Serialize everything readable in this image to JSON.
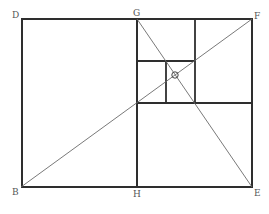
{
  "diagram": {
    "colors": {
      "background": "#ffffff",
      "frame": "#2e2e2e",
      "diagonal": "#6a6a6a",
      "label": "#555555"
    },
    "points": {
      "D": {
        "label": "D",
        "x": 22,
        "y": 19
      },
      "G": {
        "label": "G",
        "x": 137,
        "y": 19
      },
      "F": {
        "label": "F",
        "x": 252,
        "y": 19
      },
      "E": {
        "label": "E",
        "x": 252,
        "y": 187
      },
      "H": {
        "label": "H",
        "x": 137,
        "y": 187
      },
      "B": {
        "label": "B",
        "x": 21,
        "y": 187
      },
      "O": {
        "label": "O",
        "x": 175,
        "y": 75
      }
    },
    "labels": {
      "D": "D",
      "G": "G",
      "F": "F",
      "E": "E",
      "H": "H",
      "B": "B",
      "O": "O"
    },
    "segments": [
      {
        "name": "outer-rectangle",
        "from": "D",
        "to": "E"
      },
      {
        "name": "GH-divider",
        "from": "G",
        "to": "H"
      },
      {
        "name": "diagonal-BF",
        "from": "B",
        "to": "F"
      },
      {
        "name": "diagonal-GE",
        "from": "G",
        "to": "E"
      }
    ],
    "inner_lines": {
      "horizontal_lower_y": 103,
      "vertical_right_x": 195,
      "horizontal_upper_y": 61,
      "vertical_middle_x": 166
    }
  }
}
